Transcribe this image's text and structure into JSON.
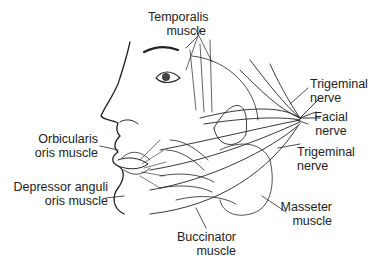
{
  "figure": {
    "labels": {
      "temporalis": {
        "line1": "Temporalis",
        "line2": "muscle"
      },
      "trigeminal_upper": {
        "line1": "Trigeminal",
        "line2": "nerve"
      },
      "facial": {
        "line1": "Facial",
        "line2": "nerve"
      },
      "trigeminal_lower": {
        "line1": "Trigeminal",
        "line2": "nerve"
      },
      "orbicularis": {
        "line1": "Orbicularis",
        "line2": "oris muscle"
      },
      "depressor": {
        "line1": "Depressor anguli",
        "line2": "oris muscle"
      },
      "masseter": {
        "line1": "Masseter",
        "line2": "muscle"
      },
      "buccinator": {
        "line1": "Buccinator",
        "line2": "muscle"
      }
    },
    "colors": {
      "ink": "#222222",
      "background": "#ffffff"
    }
  }
}
